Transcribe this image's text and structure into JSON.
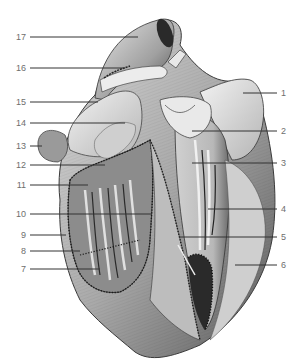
{
  "figure": {
    "left_labels": [
      {
        "num": "17",
        "y": 37,
        "x2": 138
      },
      {
        "num": "16",
        "y": 68,
        "x2": 125
      },
      {
        "num": "15",
        "y": 102,
        "x2": 98
      },
      {
        "num": "14",
        "y": 123,
        "x2": 125
      },
      {
        "num": "13",
        "y": 146,
        "x2": 42
      },
      {
        "num": "12",
        "y": 165,
        "x2": 105
      },
      {
        "num": "11",
        "y": 185,
        "x2": 88
      },
      {
        "num": "10",
        "y": 214,
        "x2": 152
      },
      {
        "num": "9",
        "y": 235,
        "x2": 66
      },
      {
        "num": "8",
        "y": 251,
        "x2": 80
      },
      {
        "num": "7",
        "y": 269,
        "x2": 100
      }
    ],
    "right_labels": [
      {
        "num": "1",
        "y": 93,
        "x1": 243
      },
      {
        "num": "2",
        "y": 131,
        "x1": 192
      },
      {
        "num": "3",
        "y": 163,
        "x1": 192
      },
      {
        "num": "4",
        "y": 209,
        "x1": 208
      },
      {
        "num": "5",
        "y": 237,
        "x1": 180
      },
      {
        "num": "6",
        "y": 265,
        "x1": 235
      }
    ]
  }
}
